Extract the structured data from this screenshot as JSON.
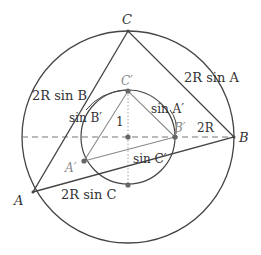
{
  "diagram": {
    "type": "geometry",
    "colors": {
      "outer_stroke": "#444444",
      "inner_triangle": "#888888",
      "dashed": "#777777",
      "points": "#666666",
      "text": "#333333"
    },
    "outer_circle": {
      "cx": 128,
      "cy": 137,
      "r": 106
    },
    "inner_circle": {
      "cx": 128,
      "cy": 137,
      "r": 47
    },
    "points": {
      "A": {
        "x": 33,
        "y": 192,
        "label": "A"
      },
      "B": {
        "x": 234,
        "y": 137,
        "label": "B"
      },
      "C": {
        "x": 128,
        "y": 31,
        "label": "C"
      },
      "A_prime": {
        "x": 84,
        "y": 161,
        "label": "A′"
      },
      "B_prime": {
        "x": 175,
        "y": 137,
        "label": "B′"
      },
      "C_prime": {
        "x": 128,
        "y": 91,
        "label": "C′"
      },
      "O": {
        "x": 128,
        "y": 137
      },
      "bottom": {
        "x": 128,
        "y": 185
      }
    },
    "labels": {
      "side_a": "2R sin A",
      "side_b": "2R sin B",
      "side_c": "2R sin C",
      "side_a_prime": "sin A′",
      "side_b_prime": "sin B′",
      "side_c_prime": "sin C′",
      "radius_inner": "1",
      "radius_outer": "2R"
    }
  }
}
